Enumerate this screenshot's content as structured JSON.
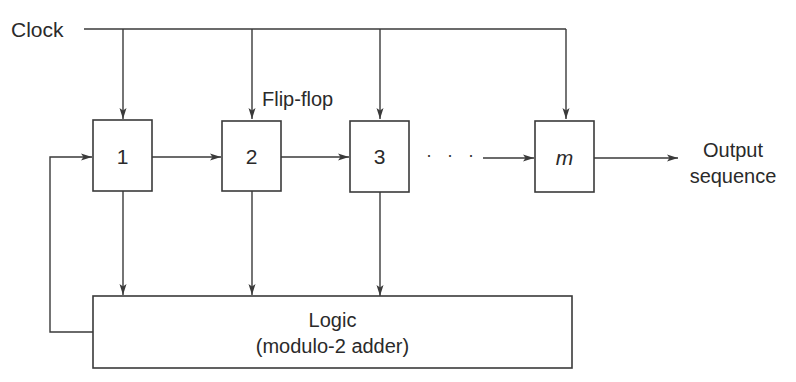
{
  "diagram": {
    "clock_label": "Clock",
    "flipflop_label": "Flip-flop",
    "ellipsis": "· · ·",
    "stages": [
      {
        "label": "1",
        "italic": false
      },
      {
        "label": "2",
        "italic": false
      },
      {
        "label": "3",
        "italic": false
      },
      {
        "label": "m",
        "italic": true
      }
    ],
    "output_label_line1": "Output",
    "output_label_line2": "sequence",
    "logic_label_line1": "Logic",
    "logic_label_line2": "(modulo-2 adder)",
    "colors": {
      "line": "#3a3a3a",
      "text": "#2a2a2a",
      "background": "#ffffff"
    }
  }
}
